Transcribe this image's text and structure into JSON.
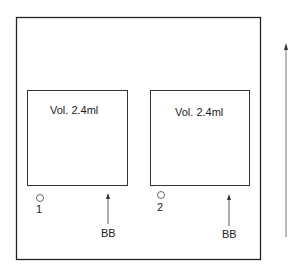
{
  "diagram": {
    "lanes": [
      {
        "volume_label": "Vol. 2.4ml",
        "well_number": "1",
        "marker_label": "BB"
      },
      {
        "volume_label": "Vol. 2.4ml",
        "well_number": "2",
        "marker_label": "BB"
      }
    ],
    "colors": {
      "stroke": "#222222",
      "background": "#ffffff"
    }
  }
}
